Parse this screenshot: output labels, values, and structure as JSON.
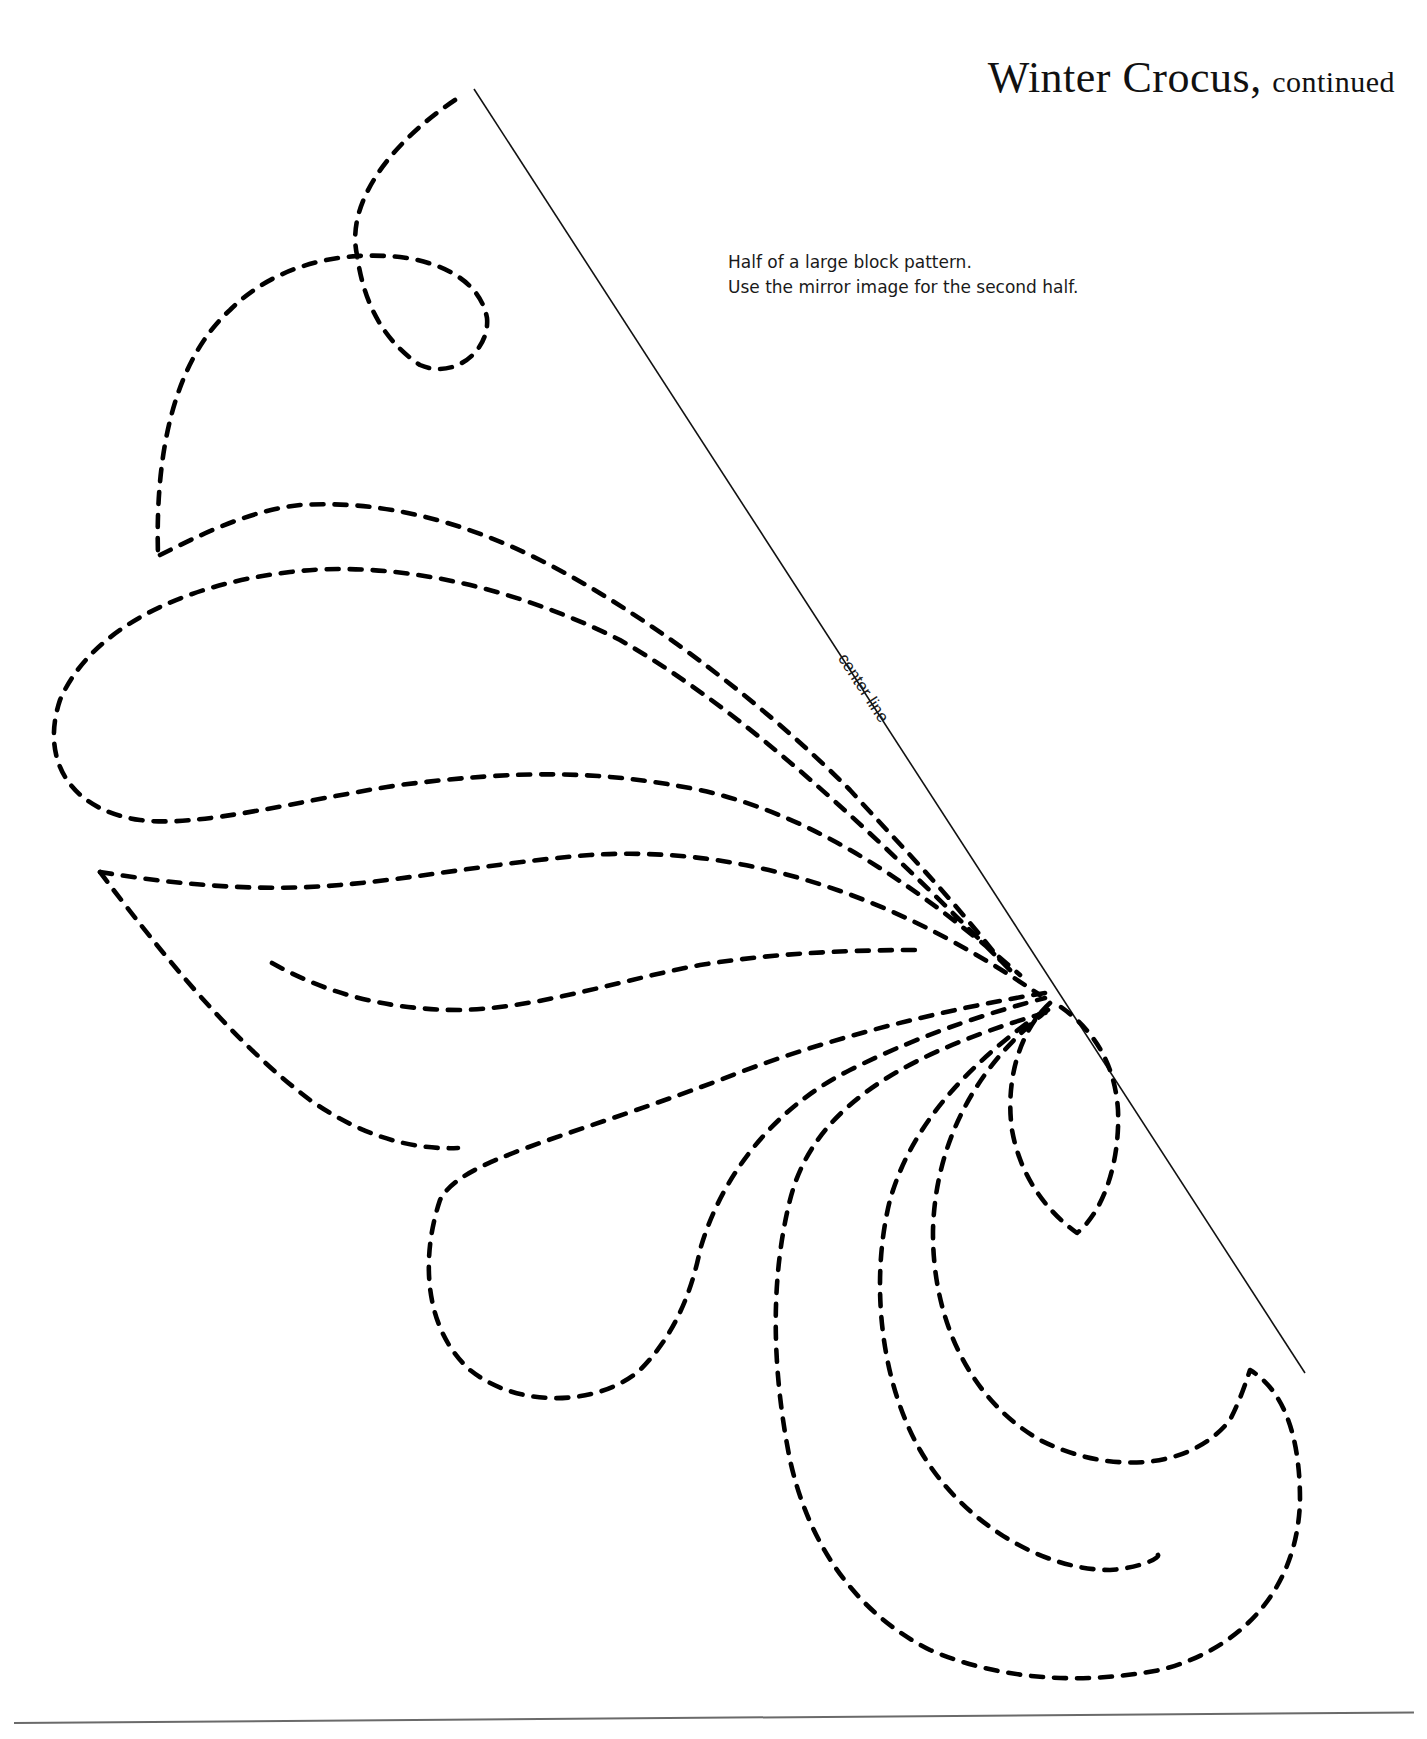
{
  "header": {
    "title": "Winter Crocus,",
    "title_suffix": "continued"
  },
  "instructions": {
    "line1": "Half of a large block pattern.",
    "line2": "Use the mirror image for the second half."
  },
  "diagram": {
    "center_line_label": "center line",
    "stroke_color": "#000000",
    "line_style": "dashed quilting stitch lines",
    "elements": [
      "upper-petal-with-loop",
      "large-left-leaf",
      "middle-leaf",
      "lower-triangular-leaf",
      "inner-stem-curve",
      "lower-teardrop-petal",
      "small-pointed-petal",
      "hook-crescent",
      "inner-curl",
      "outer-curl"
    ]
  },
  "footer": {
    "rule": "horizontal page rule"
  }
}
